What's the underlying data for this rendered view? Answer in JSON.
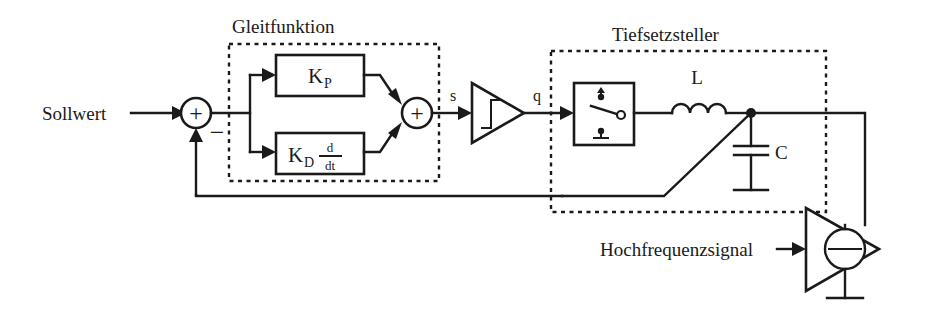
{
  "diagram": {
    "title_hidden": "Sliding-mode controlled buck converter block diagram",
    "inputs": {
      "setpoint_label": "Sollwert",
      "hf_label": "Hochfrequenzsignal"
    },
    "groups": [
      {
        "id": "gleitfunktion",
        "label": "Gleitfunktion"
      },
      {
        "id": "tiefsetzsteller",
        "label": "Tiefsetzsteller"
      }
    ],
    "blocks": [
      {
        "id": "kp",
        "label": "K",
        "subscript": "P"
      },
      {
        "id": "kd",
        "label": "K",
        "subscript": "D",
        "numerator": "d",
        "denominator": "dt"
      }
    ],
    "signals": {
      "s_label": "s",
      "q_label": "q"
    },
    "components": {
      "inductor_label": "L",
      "capacitor_label": "C"
    },
    "summing": {
      "input_sum_plus": "+",
      "input_sum_minus": "−",
      "branch_sum_plus": "+"
    },
    "colors": {
      "line": "#1a1a1a",
      "background": "#ffffff"
    }
  }
}
